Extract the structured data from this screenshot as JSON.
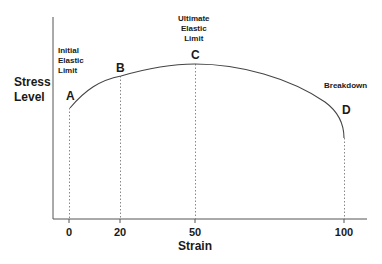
{
  "diagram": {
    "title": "",
    "y_axis_label_line1": "Stress",
    "y_axis_label_line2": "Level",
    "x_axis_label": "Strain",
    "x_ticks": [
      "0",
      "20",
      "50",
      "100"
    ],
    "points": [
      {
        "id": "A",
        "strain": 0,
        "annotation": [
          "Initial",
          "Elastic",
          "Limit"
        ]
      },
      {
        "id": "B",
        "strain": 20,
        "annotation": []
      },
      {
        "id": "C",
        "strain": 50,
        "annotation": [
          "Ultimate",
          "Elastic",
          "Limit"
        ]
      },
      {
        "id": "D",
        "strain": 100,
        "annotation": [
          "Breakdown"
        ]
      }
    ],
    "annotations": {
      "initial_line1": "Initial",
      "initial_line2": "Elastic",
      "initial_line3": "Limit",
      "ultimate_line1": "Ultimate",
      "ultimate_line2": "Elastic",
      "ultimate_line3": "Limit",
      "breakdown": "Breakdown"
    },
    "point_labels": {
      "a": "A",
      "b": "B",
      "c": "C",
      "d": "D"
    },
    "colors": {
      "axis": "#555555",
      "curve": "#444444",
      "guide": "#888888",
      "text": "#1a1a1a"
    }
  }
}
